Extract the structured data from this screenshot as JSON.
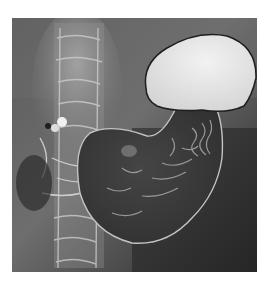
{
  "image": {
    "description": "Double-contrast barium radiograph of the stomach",
    "colors": {
      "background": "#ffffff",
      "film_dark": "#2e2e2e",
      "film_mid": "#6a6a6a",
      "spine_light": "#c8c8c8",
      "gas_bubble": "#e6e6e6",
      "mucosa_line": "#bdbdbd"
    },
    "regions": [
      {
        "name": "gastric-fundus-gas-bubble"
      },
      {
        "name": "stomach-body-mucosal-folds"
      },
      {
        "name": "lumbar-spine"
      },
      {
        "name": "duodenal-bulb-contrast"
      }
    ]
  }
}
